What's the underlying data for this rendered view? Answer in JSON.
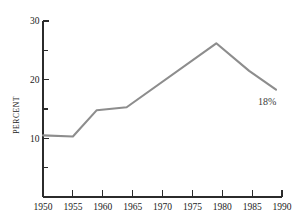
{
  "chart_data": {
    "type": "line",
    "title": "",
    "subtitle": "",
    "xlabel": "",
    "ylabel": "PERCENT",
    "xlim": [
      1950,
      1990
    ],
    "ylim": [
      0,
      30
    ],
    "grid": false,
    "legend": false,
    "legend_position": "none",
    "line_color": "#8d8d8d",
    "axis_color": "#2b2b2b",
    "background_color": "#ffffff",
    "x_ticks": [
      {
        "value": 1950,
        "label": "1950",
        "major": true
      },
      {
        "value": 1955,
        "label": "1955",
        "major": true
      },
      {
        "value": 1960,
        "label": "1960",
        "major": true
      },
      {
        "value": 1965,
        "label": "1965",
        "major": true
      },
      {
        "value": 1970,
        "label": "1970",
        "major": true
      },
      {
        "value": 1975,
        "label": "1975",
        "major": true
      },
      {
        "value": 1980,
        "label": "1980",
        "major": true
      },
      {
        "value": 1985,
        "label": "1985",
        "major": true
      },
      {
        "value": 1990,
        "label": "1990",
        "major": true
      }
    ],
    "y_ticks": [
      {
        "value": 30,
        "label": "30",
        "major": true
      },
      {
        "value": 25,
        "label": "",
        "major": false
      },
      {
        "value": 20,
        "label": "20",
        "major": true
      },
      {
        "value": 15,
        "label": "",
        "major": false
      },
      {
        "value": 10,
        "label": "10",
        "major": true
      },
      {
        "value": 5,
        "label": "",
        "major": false
      },
      {
        "value": 0,
        "label": "",
        "major": false
      }
    ],
    "series": [
      {
        "name": "percent",
        "color": "#8d8d8d",
        "x": [
          1950,
          1955,
          1959,
          1964,
          1979,
          1984.5,
          1989
        ],
        "values": [
          10.5,
          10.3,
          14.8,
          15.3,
          26.2,
          21.5,
          18.3
        ]
      }
    ],
    "annotations": [
      {
        "text": "18%",
        "x": 1987.5,
        "y": 15.6
      }
    ]
  }
}
